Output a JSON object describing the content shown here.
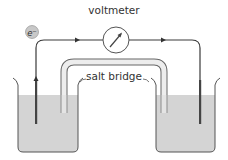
{
  "diagram": {
    "labels": {
      "voltmeter": "voltmeter",
      "salt_bridge": "salt bridge",
      "electron": "e⁻"
    },
    "components": [
      {
        "name": "left-beaker",
        "type": "beaker",
        "contains": "electrolyte solution"
      },
      {
        "name": "right-beaker",
        "type": "beaker",
        "contains": "electrolyte solution"
      },
      {
        "name": "left-electrode",
        "type": "electrode"
      },
      {
        "name": "right-electrode",
        "type": "electrode"
      },
      {
        "name": "voltmeter",
        "type": "meter"
      },
      {
        "name": "salt-bridge",
        "type": "tube"
      },
      {
        "name": "external-wire",
        "type": "wire"
      }
    ],
    "electron_flow": "left electrode → voltmeter → right electrode",
    "colors": {
      "solution": "#d4d4d4",
      "outline": "#555555",
      "wire": "#3a3a3a",
      "electron_badge": "#c8c8c8",
      "bridge_fill": "#ededed"
    }
  }
}
